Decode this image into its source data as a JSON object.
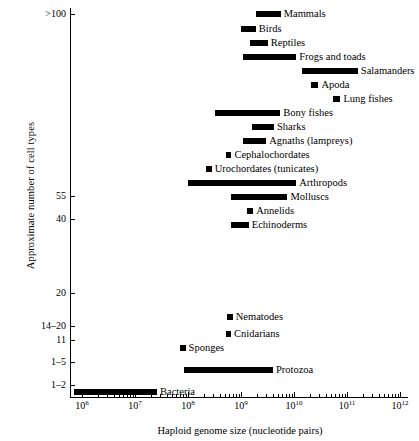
{
  "chart_data": {
    "type": "bar",
    "orientation": "horizontal-range",
    "title": "",
    "xlabel": "Haploid genome size (nucleotide pairs)",
    "ylabel": "Approximate number of cell types",
    "xscale": "log",
    "xlim": [
      1000000,
      1000000000000
    ],
    "grid": false,
    "legend": null,
    "xticks": [
      {
        "value": 1000000,
        "label": "10",
        "exp": "6"
      },
      {
        "value": 10000000,
        "label": "10",
        "exp": "7"
      },
      {
        "value": 100000000,
        "label": "10",
        "exp": "8"
      },
      {
        "value": 1000000000,
        "label": "10",
        "exp": "9"
      },
      {
        "value": 10000000000,
        "label": "10",
        "exp": "10"
      },
      {
        "value": 100000000000,
        "label": "10",
        "exp": "11"
      },
      {
        "value": 1000000000000,
        "label": "10",
        "exp": "12"
      }
    ],
    "yticks": [
      {
        "label": ">100",
        "y": 14
      },
      {
        "label": "55",
        "y": 196
      },
      {
        "label": "40",
        "y": 219
      },
      {
        "label": "20",
        "y": 293
      },
      {
        "label": "14–20",
        "y": 326
      },
      {
        "label": "11",
        "y": 340
      },
      {
        "label": "1–5",
        "y": 362
      },
      {
        "label": "1–2",
        "y": 385
      }
    ],
    "categories": [
      "Mammals",
      "Birds",
      "Reptiles",
      "Frogs and toads",
      "Salamanders",
      "Apoda",
      "Lung fishes",
      "Bony fishes",
      "Sharks",
      "Agnaths (lampreys)",
      "Cephalochordates",
      "Urochordates (tunicates)",
      "Arthropods",
      "Molluscs",
      "Annelids",
      "Echinoderms",
      "Nematodes",
      "Cnidarians",
      "Sponges",
      "Protozoa",
      "Bacteria"
    ],
    "bars": [
      {
        "name": "Mammals",
        "x_min": 1900000000.0,
        "x_max": 5600000000.0,
        "y": 11,
        "cell_types": ">100"
      },
      {
        "name": "Birds",
        "x_min": 1000000000.0,
        "x_max": 1900000000.0,
        "y": 26,
        "cell_types": ">100"
      },
      {
        "name": "Reptiles",
        "x_min": 1500000000.0,
        "x_max": 3200000000.0,
        "y": 40,
        "cell_types": ">100"
      },
      {
        "name": "Frogs and toads",
        "x_min": 1100000000.0,
        "x_max": 11000000000.0,
        "y": 54,
        "cell_types": ">100"
      },
      {
        "name": "Salamanders",
        "x_min": 14000000000.0,
        "x_max": 160000000000.0,
        "y": 68,
        "cell_types": ">100"
      },
      {
        "name": "Apoda",
        "x_min": 21000000000.0,
        "x_max": 29000000000.0,
        "y": 82,
        "cell_types": ">100"
      },
      {
        "name": "Lung fishes",
        "x_min": 55000000000.0,
        "x_max": 75000000000.0,
        "y": 96,
        "cell_types": ">100"
      },
      {
        "name": "Bony fishes",
        "x_min": 320000000.0,
        "x_max": 5500000000.0,
        "y": 110,
        "cell_types": ">100"
      },
      {
        "name": "Sharks",
        "x_min": 1600000000.0,
        "x_max": 4200000000.0,
        "y": 124,
        "cell_types": ">100"
      },
      {
        "name": "Agnaths (lampreys)",
        "x_min": 1100000000.0,
        "x_max": 3000000000.0,
        "y": 138,
        "cell_types": ">100"
      },
      {
        "name": "Cephalochordates",
        "x_min": 520000000.0,
        "x_max": 660000000.0,
        "y": 152,
        "cell_types": ">100"
      },
      {
        "name": "Urochordates (tunicates)",
        "x_min": 220000000.0,
        "x_max": 280000000.0,
        "y": 166,
        "cell_types": ">100"
      },
      {
        "name": "Arthropods",
        "x_min": 100000000.0,
        "x_max": 11000000000.0,
        "y": 180,
        "cell_types": ">100"
      },
      {
        "name": "Molluscs",
        "x_min": 650000000.0,
        "x_max": 7500000000.0,
        "y": 194,
        "cell_types": ">100"
      },
      {
        "name": "Annelids",
        "x_min": 1300000000.0,
        "x_max": 1700000000.0,
        "y": 208,
        "cell_types": "55"
      },
      {
        "name": "Echinoderms",
        "x_min": 650000000.0,
        "x_max": 1400000000.0,
        "y": 222,
        "cell_types": "40"
      },
      {
        "name": "Nematodes",
        "x_min": 550000000.0,
        "x_max": 700000000.0,
        "y": 314,
        "cell_types": "20"
      },
      {
        "name": "Cnidarians",
        "x_min": 520000000.0,
        "x_max": 650000000.0,
        "y": 331,
        "cell_types": "14–20"
      },
      {
        "name": "Sponges",
        "x_min": 70000000.0,
        "x_max": 90000000.0,
        "y": 345,
        "cell_types": "11"
      },
      {
        "name": "Protozoa",
        "x_min": 85000000.0,
        "x_max": 4000000000.0,
        "y": 367,
        "cell_types": "1–5"
      },
      {
        "name": "Bacteria",
        "x_min": 700000.0,
        "x_max": 26000000.0,
        "y": 389,
        "cell_types": "1–2"
      }
    ]
  }
}
